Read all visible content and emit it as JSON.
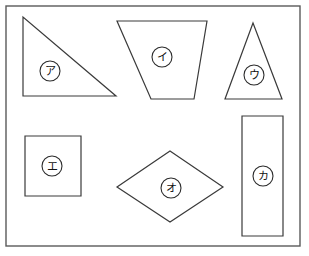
{
  "worksheet": {
    "title": "",
    "background_color": "#ffffff",
    "frame": {
      "name": "outer-frame",
      "x": 6,
      "y": 6,
      "width": 294,
      "height": 240,
      "stroke_color": "#5a5a5a"
    },
    "stroke_color": "#3a3a3a",
    "label_text_color": "#111111",
    "shapes": [
      {
        "id": "shape-a",
        "label": "ア",
        "kind": "right-triangle",
        "points": "23,17 23,96 116,96",
        "label_cx": 50,
        "label_cy": 71,
        "label_r": 10
      },
      {
        "id": "shape-i",
        "label": "イ",
        "kind": "trapezoid",
        "points": "117,21 207,21 194,99 151,99",
        "label_cx": 162,
        "label_cy": 57,
        "label_r": 10
      },
      {
        "id": "shape-u",
        "label": "ウ",
        "kind": "isosceles-triangle",
        "points": "253,23 282,99 225,99",
        "label_cx": 254,
        "label_cy": 75,
        "label_r": 10
      },
      {
        "id": "shape-e",
        "label": "エ",
        "kind": "square",
        "points": "25,136 81,136 81,196 25,196",
        "label_cx": 52,
        "label_cy": 166,
        "label_r": 10
      },
      {
        "id": "shape-o",
        "label": "オ",
        "kind": "rhombus",
        "points": "170,151 223,187 170,222 117,187",
        "label_cx": 171,
        "label_cy": 188,
        "label_r": 10
      },
      {
        "id": "shape-ka",
        "label": "カ",
        "kind": "tall-rectangle",
        "points": "242,116 283,116 283,236 242,236",
        "label_cx": 263,
        "label_cy": 176,
        "label_r": 10
      }
    ]
  }
}
